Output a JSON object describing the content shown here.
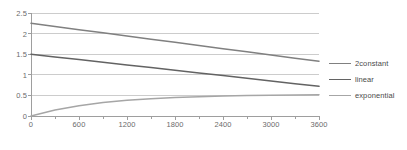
{
  "chart_data": {
    "type": "line",
    "title": "",
    "xlabel": "",
    "ylabel": "",
    "xlim": [
      0,
      3600
    ],
    "ylim": [
      0,
      2.5
    ],
    "grid": true,
    "legend_position": "right",
    "y_ticks": [
      "0",
      "0.5",
      "1",
      "1.5",
      "2",
      "2.5"
    ],
    "y_tick_values": [
      0,
      0.5,
      1,
      1.5,
      2,
      2.5
    ],
    "x_ticks": [
      "0",
      "600",
      "1200",
      "1800",
      "2400",
      "3000",
      "3600"
    ],
    "x_tick_values": [
      0,
      600,
      1200,
      1800,
      2400,
      3000,
      3600
    ],
    "x_minor_interval": 300,
    "x": [
      0,
      300,
      600,
      900,
      1200,
      1500,
      1800,
      2100,
      2400,
      2700,
      3000,
      3300,
      3600
    ],
    "series": [
      {
        "name": "2constant",
        "color": "#808080",
        "values": [
          2.25,
          2.173,
          2.096,
          2.019,
          1.942,
          1.865,
          1.788,
          1.712,
          1.635,
          1.558,
          1.481,
          1.404,
          1.33
        ]
      },
      {
        "name": "linear",
        "color": "#636363",
        "values": [
          1.5,
          1.435,
          1.37,
          1.305,
          1.24,
          1.175,
          1.11,
          1.045,
          0.98,
          0.915,
          0.85,
          0.785,
          0.72
        ]
      },
      {
        "name": "exponential",
        "color": "#a6a6a6",
        "values": [
          0.0,
          0.144,
          0.249,
          0.325,
          0.38,
          0.42,
          0.449,
          0.47,
          0.485,
          0.496,
          0.504,
          0.509,
          0.513
        ]
      }
    ]
  },
  "legend": {
    "items": [
      {
        "label": "2constant"
      },
      {
        "label": "linear"
      },
      {
        "label": "exponential"
      }
    ]
  },
  "colors": {
    "gridline": "#bfbfbf",
    "axis": "#9e9e9e",
    "tick_text": "#6b6b6b",
    "legend_text": "#4a4a4a",
    "background": "#ffffff"
  }
}
